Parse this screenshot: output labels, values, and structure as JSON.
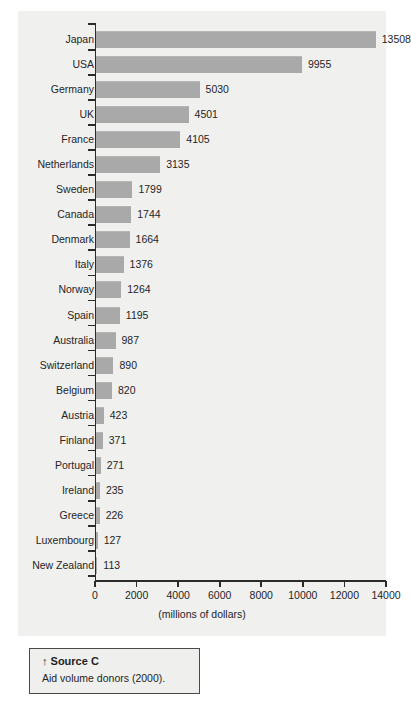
{
  "chart_data": {
    "type": "bar",
    "orientation": "horizontal",
    "title": "",
    "xlabel": "(millions of dollars)",
    "ylabel": "",
    "xlim": [
      0,
      14000
    ],
    "xticks": [
      0,
      2000,
      4000,
      6000,
      8000,
      10000,
      12000,
      14000
    ],
    "xtick_labels": [
      "0",
      "2000",
      "4000",
      "6000",
      "8000",
      "10000",
      "12000",
      "14000"
    ],
    "grid": false,
    "legend": false,
    "bar_color": "#a9a9a9",
    "panel_color": "#f0f0ef",
    "categories": [
      "Japan",
      "USA",
      "Germany",
      "UK",
      "France",
      "Netherlands",
      "Sweden",
      "Canada",
      "Denmark",
      "Italy",
      "Norway",
      "Spain",
      "Australia",
      "Switzerland",
      "Belgium",
      "Austria",
      "Finland",
      "Portugal",
      "Ireland",
      "Greece",
      "Luxembourg",
      "New Zealand"
    ],
    "values": [
      13508,
      9955,
      5030,
      4501,
      4105,
      3135,
      1799,
      1744,
      1664,
      1376,
      1264,
      1195,
      987,
      890,
      820,
      423,
      371,
      271,
      235,
      226,
      127,
      113
    ],
    "value_labels": [
      "13508",
      "9955",
      "5030",
      "4501",
      "4105",
      "3135",
      "1799",
      "1744",
      "1664",
      "1376",
      "1264",
      "1195",
      "987",
      "890",
      "820",
      "423",
      "371",
      "271",
      "235",
      "226",
      "127",
      "113"
    ]
  },
  "source": {
    "arrow": "↑",
    "title": "Source C",
    "text": "Aid volume donors (2000)."
  }
}
